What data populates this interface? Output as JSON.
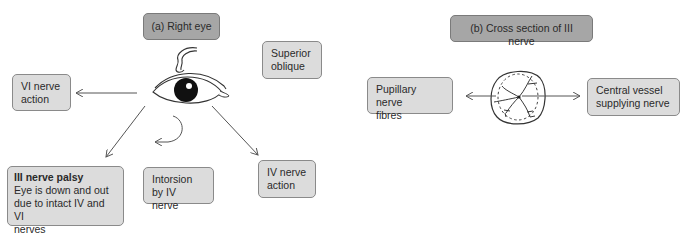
{
  "panel_a": {
    "title": "(a) Right eye",
    "superior_oblique": [
      "Superior",
      "oblique"
    ],
    "vi_nerve_action": [
      "VI nerve",
      "action"
    ],
    "iii_nerve_palsy": {
      "heading": "III nerve palsy",
      "lines": [
        "Eye is down and out",
        "due to intact IV and VI",
        "nerves"
      ]
    },
    "intorsion": [
      "Intorsion",
      "by IV nerve"
    ],
    "iv_nerve_action": [
      "IV nerve",
      "action"
    ]
  },
  "panel_b": {
    "title": "(b) Cross section of III nerve",
    "pupillary_fibres": [
      "Pupillary nerve",
      "fibres"
    ],
    "central_vessel": [
      "Central vessel",
      "supplying nerve"
    ]
  },
  "colors": {
    "title_box": "#a6a6a6",
    "label_box": "#dcdcdc",
    "border": "#8a8a8a",
    "line": "#555555"
  }
}
